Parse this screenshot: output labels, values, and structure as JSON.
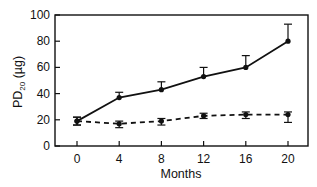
{
  "chart_data": {
    "type": "line",
    "title": "",
    "xlabel": "Months",
    "ylabel": "PD",
    "ylabel_sub": "20",
    "ylabel_unit": " (µg)",
    "x": [
      0,
      4,
      8,
      12,
      16,
      20
    ],
    "xticks": [
      "0",
      "4",
      "8",
      "12",
      "16",
      "20"
    ],
    "yticks": [
      "0",
      "20",
      "40",
      "60",
      "80",
      "100"
    ],
    "ylim": [
      0,
      100
    ],
    "xlim": [
      -2,
      22
    ],
    "grid": false,
    "legend": null,
    "series": [
      {
        "name": "solid",
        "style": "solid",
        "values": [
          19,
          37,
          43,
          53,
          60,
          80
        ],
        "err_up": [
          3,
          4,
          6,
          7,
          9,
          13
        ],
        "err_down": [
          3,
          0,
          0,
          0,
          0,
          0
        ]
      },
      {
        "name": "dashed",
        "style": "dashed",
        "values": [
          19,
          17,
          19,
          23,
          24,
          24
        ],
        "err_up": [
          3,
          2,
          2,
          2,
          2,
          2
        ],
        "err_down": [
          3,
          3,
          3,
          2,
          3,
          6
        ]
      }
    ]
  }
}
